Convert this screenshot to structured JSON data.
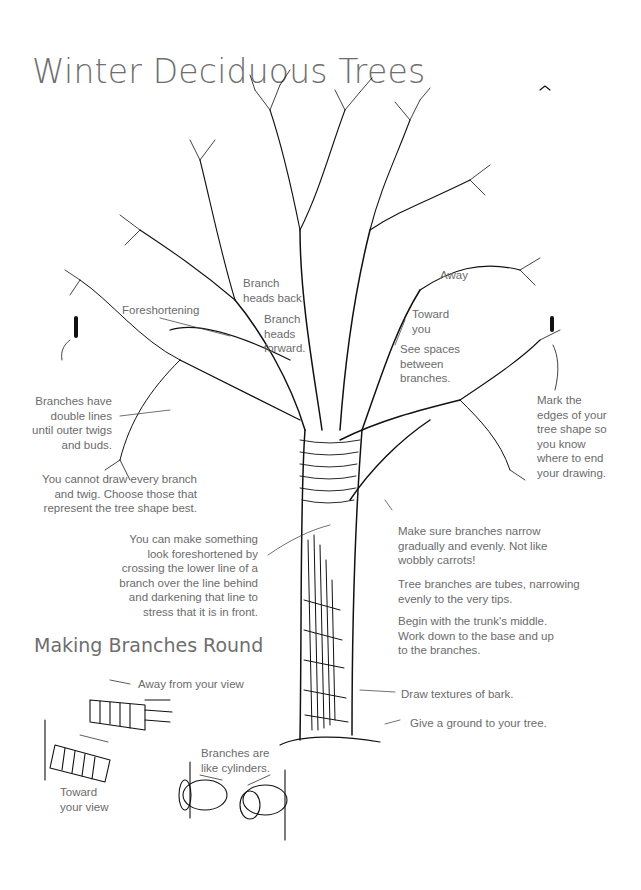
{
  "title": "Winter Deciduous Trees",
  "section_title": "Making Branches Round",
  "annotations": {
    "foreshortening": "Foreshortening",
    "branch_heads_back": "Branch\nheads back.",
    "branch_heads_forward": "Branch\nheads\nforward.",
    "away": "Away",
    "toward_you": "Toward\nyou",
    "see_spaces": "See spaces\nbetween\nbranches.",
    "double_lines": "Branches have\ndouble lines\nuntil outer twigs\nand buds.",
    "mark_edges": "Mark the\nedges of your\ntree shape so\nyou know\nwhere to end\nyour drawing.",
    "cannot_draw_every": "You cannot draw every branch\nand twig. Choose those that\nrepresent the tree shape best.",
    "foreshortened_tip": "You can make something\nlook foreshortened by\ncrossing the lower line of a\nbranch over the line behind\nand darkening that line to\nstress that it is in front.",
    "narrow_gradually": "Make sure branches narrow\ngradually and evenly. Not like\nwobbly carrots!",
    "tubes": "Tree branches are tubes, narrowing\nevenly to the very tips.",
    "begin_middle": "Begin with the trunk's middle.\nWork down to the base and up\nto the branches.",
    "bark": "Draw textures of bark.",
    "ground": "Give a ground to your tree.",
    "away_from_view": "Away from your view",
    "toward_view": "Toward\nyour view",
    "cylinders": "Branches are\nlike cylinders."
  },
  "colors": {
    "ink": "#111111",
    "text": "#6b6b6b",
    "background": "#ffffff"
  }
}
